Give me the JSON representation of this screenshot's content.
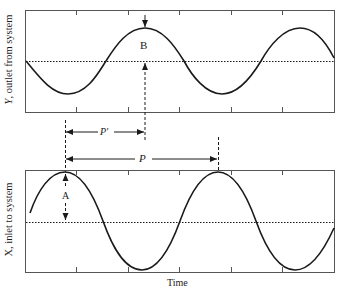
{
  "figure": {
    "top_panel": {
      "ylabel_var": "Y",
      "ylabel_rest": ", outlet from system",
      "marker_label": "B",
      "description": "output sinusoid, smaller amplitude, lagging input"
    },
    "bottom_panel": {
      "ylabel": "X, inlet to system",
      "marker_label": "A",
      "description": "input sinusoid, larger amplitude"
    },
    "period_label": "P",
    "lag_label": "P′",
    "xlabel": "Time",
    "colors": {
      "line": "#1a1a1a",
      "frame": "#555555",
      "background": "#ffffff"
    }
  }
}
